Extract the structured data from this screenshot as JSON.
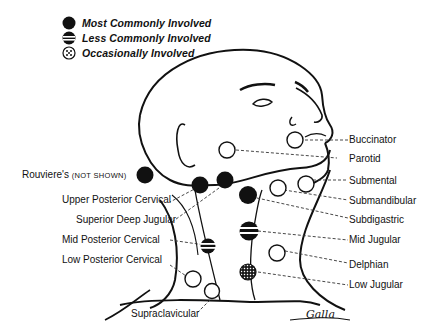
{
  "legend": {
    "items": [
      {
        "symbol": "solid-dot",
        "label": "Most Commonly Involved"
      },
      {
        "symbol": "striped-dot",
        "label": "Less Commonly Involved"
      },
      {
        "symbol": "dotted-dot",
        "label": "Occasionally Involved"
      }
    ]
  },
  "labels": {
    "left": [
      {
        "name": "Rouviere's",
        "note": "(NOT SHOWN)",
        "symbol": "solid-dot"
      },
      {
        "name": "Upper Posterior Cervical"
      },
      {
        "name": "Superior Deep Jugular"
      },
      {
        "name": "Mid Posterior Cervical"
      },
      {
        "name": "Low Posterior Cervical"
      },
      {
        "name": "Supraclavicular"
      }
    ],
    "right": [
      {
        "name": "Buccinator"
      },
      {
        "name": "Parotid"
      },
      {
        "name": "Submental"
      },
      {
        "name": "Submandibular"
      },
      {
        "name": "Subdigastric"
      },
      {
        "name": "Mid Jugular"
      },
      {
        "name": "Delphian"
      },
      {
        "name": "Low Jugular"
      }
    ]
  },
  "signature": "Galla",
  "colors": {
    "ink": "#111111",
    "background": "#ffffff"
  }
}
